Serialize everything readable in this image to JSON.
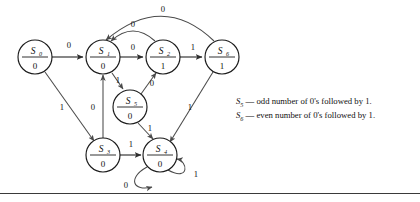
{
  "figure": {
    "type": "state-transition-diagram",
    "title": "",
    "states": [
      {
        "id": "S0",
        "name": "S",
        "subscript": "0",
        "output": "0",
        "cx": 35,
        "cy": 57,
        "r": 17
      },
      {
        "id": "S1",
        "name": "S",
        "subscript": "1",
        "output": "0",
        "cx": 103,
        "cy": 57,
        "r": 17
      },
      {
        "id": "S2",
        "name": "S",
        "subscript": "2",
        "output": "1",
        "cx": 163,
        "cy": 57,
        "r": 17
      },
      {
        "id": "S6",
        "name": "S",
        "subscript": "6",
        "output": "1",
        "cx": 222,
        "cy": 57,
        "r": 17
      },
      {
        "id": "S5",
        "name": "S",
        "subscript": "5",
        "output": "0",
        "cx": 130,
        "cy": 107,
        "r": 17
      },
      {
        "id": "S3",
        "name": "S",
        "subscript": "3",
        "output": "0",
        "cx": 103,
        "cy": 155,
        "r": 17
      },
      {
        "id": "S4",
        "name": "S",
        "subscript": "4",
        "output": "0",
        "cx": 160,
        "cy": 155,
        "r": 17
      }
    ],
    "transitions": [
      {
        "from": "S0",
        "to": "S1",
        "label": "0",
        "lx": 69,
        "ly": 48
      },
      {
        "from": "S0",
        "to": "S3",
        "label": "1",
        "lx": 62,
        "ly": 110
      },
      {
        "from": "S1",
        "to": "S2",
        "label": "0",
        "lx": 133,
        "ly": 50
      },
      {
        "from": "S1",
        "to": "S5",
        "label": "1",
        "lx": 118,
        "ly": 83
      },
      {
        "from": "S2",
        "to": "S6",
        "label": "1",
        "lx": 193,
        "ly": 50
      },
      {
        "from": "S2",
        "to": "S1",
        "label": "0",
        "lx": 133,
        "ly": 27
      },
      {
        "from": "S6",
        "to": "S1",
        "label": "0",
        "lx": 163,
        "ly": 11
      },
      {
        "from": "S6",
        "to": "S4",
        "label": "1",
        "lx": 190,
        "ly": 110
      },
      {
        "from": "S5",
        "to": "S2",
        "label": "0",
        "lx": 152,
        "ly": 86
      },
      {
        "from": "S5",
        "to": "S4",
        "label": "1",
        "lx": 150,
        "ly": 130
      },
      {
        "from": "S3",
        "to": "S1",
        "label": "0",
        "lx": 93,
        "ly": 110
      },
      {
        "from": "S3",
        "to": "S4",
        "label": "1",
        "lx": 131,
        "ly": 146
      },
      {
        "from": "S4",
        "to": "S4",
        "label": "0",
        "lx": 126,
        "ly": 186
      },
      {
        "from": "S4",
        "to": "S4",
        "label": "1",
        "lx": 196,
        "ly": 176
      }
    ],
    "legend": [
      {
        "state": "S",
        "subscript": "5",
        "dash": "—",
        "text": "odd number of 0's followed by 1."
      },
      {
        "state": "S",
        "subscript": "6",
        "dash": "—",
        "text": "even number of 0's followed by 1."
      }
    ],
    "colors": {
      "node_stroke": "#1b1b1b",
      "edge_stroke": "#4a4a4a",
      "text": "#111111",
      "background": "#ffffff",
      "rule": "#3a3a3a"
    }
  }
}
